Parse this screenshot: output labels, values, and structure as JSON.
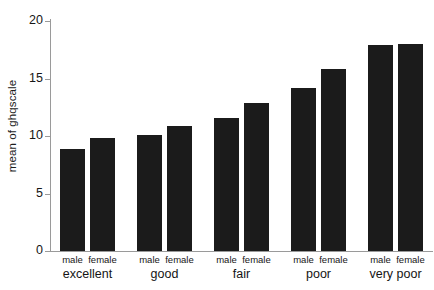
{
  "chart_data": {
    "type": "bar",
    "title": "",
    "subtitle": "",
    "xlabel": "",
    "ylabel": "mean of ghqscale",
    "ylim": [
      0,
      20
    ],
    "yticks": [
      0,
      5,
      10,
      15,
      20
    ],
    "ytick_labels": [
      "0",
      "5",
      "10",
      "15",
      "20"
    ],
    "grid": false,
    "legend": "none",
    "bar_color": "#1b1b1b",
    "axis_color": "#9a9a9a",
    "categories": [
      "excellent",
      "good",
      "fair",
      "poor",
      "very poor"
    ],
    "series": [
      {
        "name": "male",
        "values": [
          8.9,
          10.1,
          11.6,
          14.2,
          17.9
        ]
      },
      {
        "name": "female",
        "values": [
          9.8,
          10.9,
          12.9,
          15.8,
          18.0
        ]
      }
    ],
    "bars": [
      {
        "group": "excellent",
        "series": "male",
        "value": 8.9
      },
      {
        "group": "excellent",
        "series": "female",
        "value": 9.8
      },
      {
        "group": "good",
        "series": "male",
        "value": 10.1
      },
      {
        "group": "good",
        "series": "female",
        "value": 10.9
      },
      {
        "group": "fair",
        "series": "male",
        "value": 11.6
      },
      {
        "group": "fair",
        "series": "female",
        "value": 12.9
      },
      {
        "group": "poor",
        "series": "male",
        "value": 14.2
      },
      {
        "group": "poor",
        "series": "female",
        "value": 15.8
      },
      {
        "group": "very poor",
        "series": "male",
        "value": 17.9
      },
      {
        "group": "very poor",
        "series": "female",
        "value": 18.0
      }
    ]
  },
  "axis": {
    "y_title": "mean of ghqscale"
  }
}
